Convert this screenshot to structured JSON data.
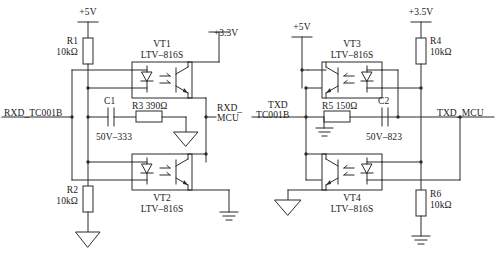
{
  "diagram": {
    "stroke_color": "#2b2b2b",
    "text_color": "#1a1a1a",
    "background": "#ffffff"
  },
  "left_block": {
    "rail_top": "+5V",
    "rail_right": "+3.3V",
    "signal_in": "RXD_TC001B",
    "signal_out_line1": "RXD_",
    "signal_out_line2": "MCU",
    "r1_name": "R1",
    "r1_value": "10kΩ",
    "r2_name": "R2",
    "r2_value": "10kΩ",
    "r3_label": "R3 390Ω",
    "c1_name": "C1",
    "c1_value": "50V–333",
    "vt1_name": "VT1",
    "vt1_part": "LTV–816S",
    "vt2_name": "VT2",
    "vt2_part": "LTV–816S"
  },
  "right_block": {
    "rail_top": "+5V",
    "rail_right": "+3.5V",
    "signal_in_line1": "TXD",
    "signal_in_line2": "TC001B",
    "signal_out": "TXD_MCU",
    "r4_name": "R4",
    "r4_value": "10kΩ",
    "r6_name": "R6",
    "r6_value": "10kΩ",
    "r5_label": "R5 150Ω",
    "c2_name": "C2",
    "c2_value": "50V–823",
    "vt3_name": "VT3",
    "vt3_part": "LTV–816S",
    "vt4_name": "VT4",
    "vt4_part": "LTV–816S"
  }
}
